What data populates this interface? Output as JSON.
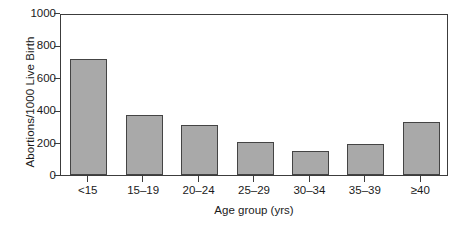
{
  "chart_data": {
    "type": "bar",
    "title": "",
    "xlabel": "Age group (yrs)",
    "ylabel": "Abortions/1000 Live Birth",
    "categories": [
      "<15",
      "15–19",
      "20–24",
      "25–29",
      "30–34",
      "35–39",
      "≥40"
    ],
    "values": [
      715,
      370,
      310,
      205,
      148,
      192,
      325
    ],
    "ylim": [
      0,
      1000
    ],
    "yticks": [
      0,
      200,
      400,
      600,
      800,
      1000
    ],
    "ytick_labels": [
      "0",
      "200",
      "400",
      "600",
      "800",
      "1000"
    ],
    "grid": false,
    "legend": false,
    "bar_color": "#a9a9a9",
    "bar_edge_color": "#444444",
    "axis_color": "#3c3c3c",
    "background": "#ffffff"
  }
}
